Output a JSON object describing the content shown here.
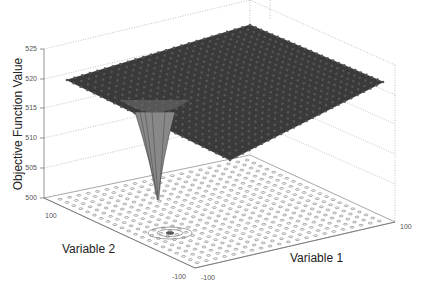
{
  "chart_data": {
    "type": "surface3d",
    "title": "",
    "xlabel": "Variable 1",
    "ylabel": "Variable 2",
    "zlabel": "Objective Function Value",
    "xlim": [
      -100,
      100
    ],
    "ylim": [
      -100,
      100
    ],
    "zlim": [
      500,
      525
    ],
    "x_ticks": [
      "-100",
      "100"
    ],
    "y_ticks": [
      "100",
      "-100"
    ],
    "z_ticks": [
      "500",
      "505",
      "510",
      "515",
      "520",
      "525"
    ],
    "grid": true,
    "surface": {
      "description": "Rippled (egg-crate) plateau around z≈520 with a sharp funnel-shaped global minimum dropping to ≈500 near Variable 1≈-60, Variable 2≈-40",
      "plateau_value": 520,
      "ripple_amplitude": 1,
      "global_minimum": {
        "x": -60,
        "y": -40,
        "z": 500
      },
      "color": "#3a3a3a"
    },
    "contour_projection": "Contour rings projected on the floor plane (z=500), concentric around the minimum",
    "legend": null
  },
  "axes": {
    "z_tick_labels": [
      "525",
      "520",
      "515",
      "510",
      "505",
      "500"
    ],
    "y_tick_left": "100",
    "y_tick_front": "-100",
    "x_tick_front": "-100",
    "x_tick_right": "100",
    "x_label": "Variable 1",
    "y_label": "Variable 2",
    "z_label": "Objective Function Value"
  }
}
